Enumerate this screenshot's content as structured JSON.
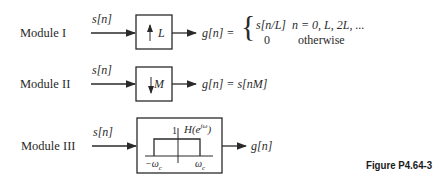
{
  "modules": [
    {
      "label": "Module I",
      "input": "s[n]",
      "block": "L",
      "block_arrow": "up",
      "output_lhs": "g[n] =",
      "cases": [
        {
          "expr": "s[n/L]",
          "cond": "n = 0, L, 2L, ..."
        },
        {
          "expr": "0",
          "cond": "otherwise"
        }
      ]
    },
    {
      "label": "Module II",
      "input": "s[n]",
      "block": "M",
      "block_arrow": "down",
      "output": "g[n] = s[nM]"
    },
    {
      "label": "Module III",
      "input": "s[n]",
      "filter": {
        "title": "H(e",
        "title_sup": "jω",
        "title_close": ")",
        "gain": "1",
        "left_cutoff": "−ω",
        "right_cutoff": "ω",
        "cutoff_sub": "c"
      },
      "output": "g[n]"
    }
  ],
  "caption": "Figure P4.64-3"
}
